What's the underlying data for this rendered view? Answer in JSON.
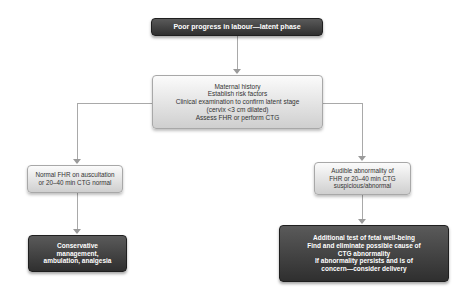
{
  "diagram": {
    "title_node": {
      "lines": [
        "Poor progress in labour—latent phase"
      ]
    },
    "assessment_node": {
      "lines": [
        "Maternal history",
        "Establish risk factors",
        "Clinical examination to confirm latent stage",
        "(cervix <3 cm dilated)",
        "Assess FHR or perform CTG"
      ]
    },
    "normal_branch": {
      "condition_lines": [
        "Normal FHR on auscultation",
        "or 20–40 min CTG normal"
      ],
      "action_lines": [
        "Conservative",
        "management,",
        "ambulation, analgesia"
      ]
    },
    "abnormal_branch": {
      "condition_lines": [
        "Audible abnormality of",
        "FHR or 20–40 min CTG",
        "suspicious/abnormal"
      ],
      "action_lines": [
        "Additional test of fetal well-being",
        "Find and eliminate possible cause of",
        "CTG abnormality",
        "If abnormality persists and is of",
        "concern—consider delivery"
      ]
    },
    "colors": {
      "dark_box": "#3a3a3a",
      "light_box": "#e6e6e6",
      "connector": "#a9a9a9",
      "dark_text": "#ffffff",
      "light_text": "#333333"
    }
  }
}
